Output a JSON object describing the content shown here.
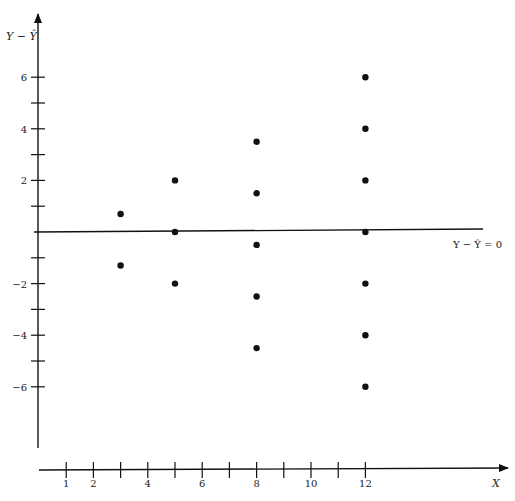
{
  "chart_data": {
    "type": "scatter",
    "title": "",
    "xlabel": "X",
    "ylabel": "Y − Ŷ",
    "reference_line": {
      "y": 0,
      "label": "Y − Ŷ = 0"
    },
    "xlim": [
      0,
      15.5
    ],
    "ylim": [
      -8,
      7.5
    ],
    "grid": false,
    "legend": null,
    "x_ticks": [
      1,
      2,
      3,
      4,
      5,
      6,
      7,
      8,
      9,
      10,
      11,
      12
    ],
    "x_tick_labels": [
      "1",
      "2",
      "",
      "4",
      "",
      "6",
      "",
      "8",
      "",
      "10",
      "",
      "12"
    ],
    "y_ticks": [
      -6,
      -5,
      -4,
      -3,
      -2,
      -1,
      1,
      2,
      3,
      4,
      5,
      6
    ],
    "y_tick_labels": [
      "−6",
      "",
      "−4",
      "",
      "−2",
      "",
      "",
      "2",
      "",
      "4",
      "",
      "6"
    ],
    "series": [
      {
        "name": "residuals",
        "points": [
          {
            "x": 3,
            "y": 0.7
          },
          {
            "x": 3,
            "y": -1.3
          },
          {
            "x": 5,
            "y": 2
          },
          {
            "x": 5,
            "y": 0
          },
          {
            "x": 5,
            "y": -2
          },
          {
            "x": 8,
            "y": 3.5
          },
          {
            "x": 8,
            "y": 1.5
          },
          {
            "x": 8,
            "y": -0.5
          },
          {
            "x": 8,
            "y": -2.5
          },
          {
            "x": 8,
            "y": -4.5
          },
          {
            "x": 12,
            "y": 6
          },
          {
            "x": 12,
            "y": 4
          },
          {
            "x": 12,
            "y": 2
          },
          {
            "x": 12,
            "y": 0
          },
          {
            "x": 12,
            "y": -2
          },
          {
            "x": 12,
            "y": -4
          },
          {
            "x": 12,
            "y": -6
          }
        ]
      }
    ],
    "colors": {
      "ink": "#111111",
      "background": "#ffffff"
    }
  },
  "labels": {
    "y_axis_title": "Y − Ŷ",
    "x_axis_title": "X",
    "zero_line_label": "Y − Ŷ = 0"
  }
}
